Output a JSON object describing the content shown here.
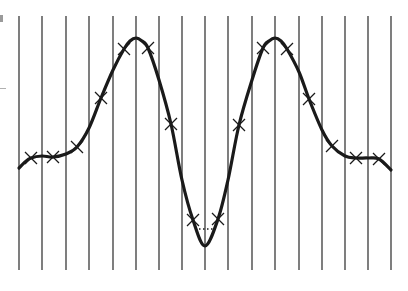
{
  "chart_data": {
    "type": "line",
    "title": "",
    "xlabel": "",
    "ylabel": "",
    "grid": {
      "vertical": true,
      "horizontal": false,
      "count": 17
    },
    "gridlines_x_px": [
      19,
      42,
      66,
      89,
      113,
      136,
      159,
      182,
      205,
      228,
      252,
      275,
      299,
      322,
      345,
      368,
      391
    ],
    "gridline_y_range_px": [
      16,
      270
    ],
    "curve_px": [
      [
        19,
        168
      ],
      [
        25,
        162
      ],
      [
        31,
        158
      ],
      [
        42,
        156
      ],
      [
        53,
        157
      ],
      [
        66,
        154
      ],
      [
        77,
        147
      ],
      [
        89,
        128
      ],
      [
        101,
        98
      ],
      [
        113,
        70
      ],
      [
        124,
        49
      ],
      [
        130,
        41
      ],
      [
        136,
        38
      ],
      [
        142,
        41
      ],
      [
        148,
        48
      ],
      [
        159,
        80
      ],
      [
        171,
        124
      ],
      [
        182,
        180
      ],
      [
        193,
        220
      ],
      [
        205,
        246
      ],
      [
        218,
        219
      ],
      [
        228,
        180
      ],
      [
        239,
        125
      ],
      [
        252,
        80
      ],
      [
        263,
        48
      ],
      [
        269,
        41
      ],
      [
        275,
        38
      ],
      [
        281,
        41
      ],
      [
        287,
        49
      ],
      [
        299,
        72
      ],
      [
        309,
        99
      ],
      [
        322,
        130
      ],
      [
        332,
        146
      ],
      [
        345,
        156
      ],
      [
        356,
        158
      ],
      [
        368,
        158
      ],
      [
        379,
        159
      ],
      [
        391,
        170
      ]
    ],
    "markers": {
      "shape": "cross",
      "points_px": [
        [
          31,
          158
        ],
        [
          53,
          157
        ],
        [
          77,
          147
        ],
        [
          101,
          98
        ],
        [
          124,
          49
        ],
        [
          148,
          48
        ],
        [
          171,
          124
        ],
        [
          193,
          220
        ],
        [
          218,
          219
        ],
        [
          239,
          125
        ],
        [
          263,
          48
        ],
        [
          287,
          49
        ],
        [
          309,
          99
        ],
        [
          332,
          146
        ],
        [
          356,
          158
        ],
        [
          379,
          159
        ]
      ]
    },
    "dotted_segment_px": [
      [
        195,
        229
      ],
      [
        216,
        229
      ]
    ],
    "colors": {
      "curve": "#1a1a1a",
      "grid": "#3a3a3a",
      "background": "#ffffff"
    }
  }
}
